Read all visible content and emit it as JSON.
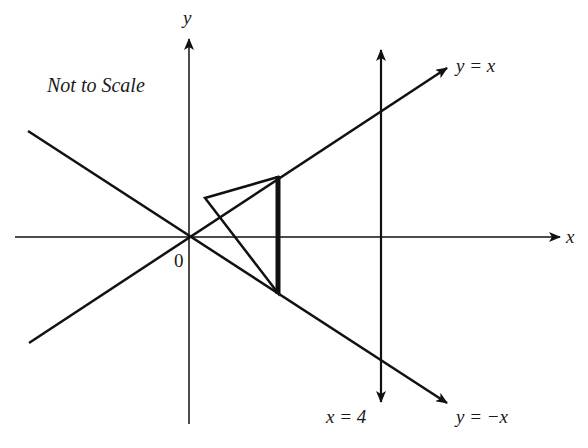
{
  "diagram": {
    "note": "Not to Scale",
    "axes": {
      "x_label": "x",
      "y_label": "y",
      "origin_label": "0"
    },
    "lines": [
      {
        "id": "y_eq_x",
        "label": "y = x"
      },
      {
        "id": "y_eq_neg_x",
        "label": "y = −x"
      },
      {
        "id": "x_eq_4",
        "label": "x = 4"
      }
    ],
    "shapes": {
      "triangle": {
        "description": "triangle with vertical side on y = x / y = -x segment"
      },
      "thick_segment": {
        "description": "bold vertical segment between y = x and y = -x"
      }
    },
    "colors": {
      "ink": "#111111",
      "background": "#ffffff"
    }
  }
}
